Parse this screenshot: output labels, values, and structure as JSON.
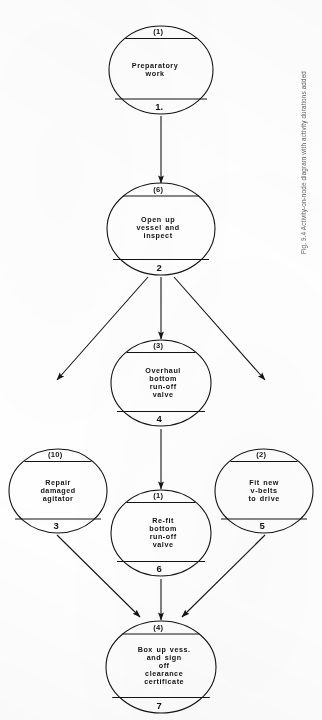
{
  "figure": {
    "caption": "Fig. 9.4  Activity-on-node diagram with activity durations added",
    "ink_color": "#131313",
    "paper_color": "#ffffff",
    "caption_color": "#5d5d5d"
  },
  "diagram": {
    "type": "activity-on-node network",
    "orientation": "page rotated 90 degrees counter-clockwise",
    "node_shape": "ellipse divided into three bands: id / description / duration",
    "nodes": [
      {
        "id": "1",
        "id_label": "1.",
        "description": "Preparatory\nwork",
        "duration": "(1)"
      },
      {
        "id": "2",
        "id_label": "2",
        "description": "Open up\nvessel and\ninspect",
        "duration": "(6)"
      },
      {
        "id": "3",
        "id_label": "3",
        "description": "Repair\ndamaged\nagitator",
        "duration": "(10)"
      },
      {
        "id": "4",
        "id_label": "4",
        "description": "Overhaul\nbottom\nrun-off\nvalve",
        "duration": "(3)"
      },
      {
        "id": "5",
        "id_label": "5",
        "description": "Fit new\nv-belts\nto drive",
        "duration": "(2)"
      },
      {
        "id": "6",
        "id_label": "6",
        "description": "Re-fit\nbottom\nrun-off\nvalve",
        "duration": "(1)"
      },
      {
        "id": "7",
        "id_label": "7",
        "description": "Box up vess.\nand sign\noff\nclearance\ncertificate",
        "duration": "(4)"
      }
    ],
    "edges": [
      {
        "from": "1",
        "to": "2"
      },
      {
        "from": "2",
        "to": "3"
      },
      {
        "from": "2",
        "to": "4"
      },
      {
        "from": "2",
        "to": "5"
      },
      {
        "from": "4",
        "to": "6"
      },
      {
        "from": "3",
        "to": "7"
      },
      {
        "from": "6",
        "to": "7"
      },
      {
        "from": "5",
        "to": "7"
      }
    ]
  }
}
